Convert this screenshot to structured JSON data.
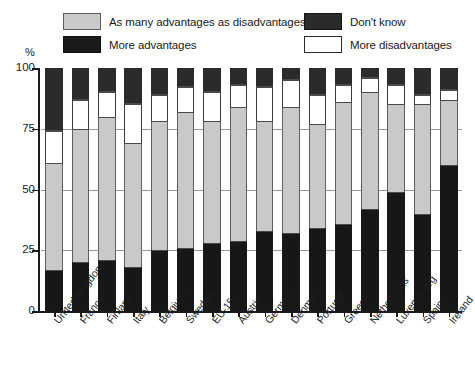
{
  "axis": {
    "y_unit_label": "%",
    "y_ticks": [
      "100",
      "75",
      "50",
      "25",
      "0"
    ]
  },
  "legend": {
    "many_label": "As many advantages as disadvantages",
    "more_advantages_label": "More advantages",
    "dont_know_label": "Don't know",
    "more_disadvantages_label": "More disadvantages",
    "colors": {
      "many": "#c9c9c9",
      "more_advantages": "#171717",
      "dont_know": "#2b2b2b",
      "more_disadvantages": "#ffffff"
    }
  },
  "chart_data": {
    "type": "bar",
    "subtype": "stacked-vertical-100",
    "title": "",
    "subtitle": "",
    "xlabel": "",
    "ylabel": "%",
    "ylim": [
      0,
      100
    ],
    "yticks": [
      0,
      25,
      50,
      75,
      100
    ],
    "grid": true,
    "legend_position": "top",
    "categories": [
      "United Kingdom",
      "France",
      "Finland",
      "Italy",
      "Belgium",
      "Sweden",
      "EU-15",
      "Austria",
      "Germany",
      "Denmark",
      "Portugal",
      "Greece",
      "Netherlands",
      "Luxembourg",
      "Spain",
      "Ireland"
    ],
    "series": [
      {
        "name": "More advantages",
        "color": "#171717",
        "values": [
          17,
          20,
          21,
          18,
          25,
          26,
          28,
          29,
          33,
          32,
          34,
          36,
          42,
          49,
          40,
          60
        ]
      },
      {
        "name": "As many advantages as disadvantages",
        "color": "#c9c9c9",
        "values": [
          44,
          55,
          59,
          51,
          53,
          56,
          50,
          55,
          45,
          52,
          43,
          50,
          48,
          36,
          45,
          27
        ]
      },
      {
        "name": "More disadvantages",
        "color": "#ffffff",
        "values": [
          13,
          12,
          10,
          16,
          11,
          10,
          12,
          9,
          14,
          11,
          12,
          7,
          6,
          8,
          4,
          4
        ]
      },
      {
        "name": "Don't know",
        "color": "#2b2b2b",
        "values": [
          26,
          13,
          10,
          15,
          11,
          8,
          10,
          7,
          8,
          5,
          11,
          7,
          4,
          7,
          11,
          9
        ]
      }
    ]
  }
}
